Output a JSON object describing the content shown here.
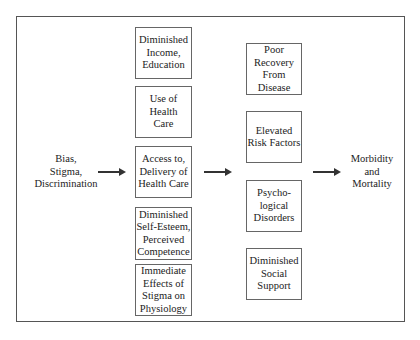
{
  "diagram": {
    "source": "Bias,\nStigma,\nDiscrimination",
    "outcome": "Morbidity\nand\nMortality",
    "mediators_left": [
      "Diminished\nIncome,\nEducation",
      "Use of\nHealth\nCare",
      "Access to,\nDelivery of\nHealth Care",
      "Diminished\nSelf-Esteem,\nPerceived\nCompetence",
      "Immediate\nEffects of\nStigma on\nPhysiology"
    ],
    "mediators_right": [
      "Poor\nRecovery\nFrom\nDisease",
      "Elevated\nRisk Factors",
      "Psycho-\nlogical\nDisorders",
      "Diminished\nSocial\nSupport"
    ],
    "arrows": [
      {
        "from": "source",
        "to": "mediators_left"
      },
      {
        "from": "mediators_left",
        "to": "mediators_right"
      },
      {
        "from": "mediators_right",
        "to": "outcome"
      }
    ]
  }
}
